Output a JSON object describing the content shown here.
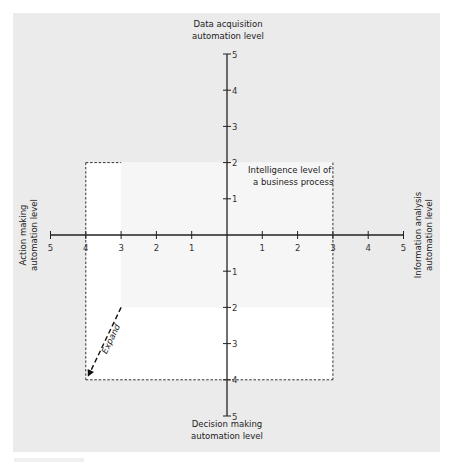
{
  "diagram": {
    "title": "Intelligence level of a business process",
    "title_lines": [
      "Intelligence level of",
      "a business process"
    ],
    "axes": {
      "top": {
        "label_lines": [
          "Data acquisition",
          "automation level"
        ],
        "max": 5
      },
      "right": {
        "label_lines": [
          "Information analysis",
          "automation level"
        ],
        "max": 5
      },
      "bottom": {
        "label_lines": [
          "Decision making",
          "automation level"
        ],
        "max": 5
      },
      "left": {
        "label_lines": [
          "Action making",
          "automation level"
        ],
        "max": 5
      }
    },
    "ticks": [
      "1",
      "2",
      "3",
      "4",
      "5"
    ],
    "original_area": {
      "top": 2,
      "right": 3,
      "bottom": 2,
      "left": 3
    },
    "expanded_area": {
      "top": 2,
      "right": 3,
      "bottom": 4,
      "left": 4
    },
    "arrow": {
      "label": "Expand",
      "from": {
        "x": -3,
        "y": -2
      },
      "to": {
        "x": -4,
        "y": -4
      }
    },
    "colors": {
      "panel_bg": "#ebebeb",
      "area_fill": "#ffffff",
      "original_area_fill": "#f6f6f6",
      "axis": "#222222",
      "dash": "#333333"
    }
  }
}
